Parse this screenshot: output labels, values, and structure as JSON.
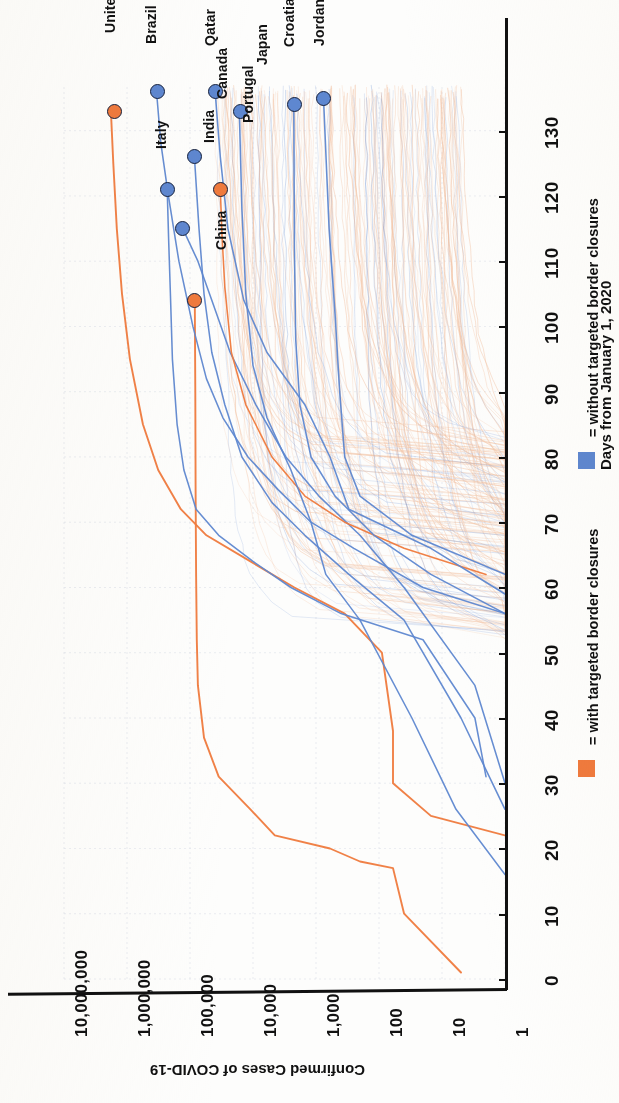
{
  "chart_data": {
    "type": "line",
    "title": "",
    "xlabel": "Days from January 1, 2020",
    "ylabel": "Confirmed Cases of COVID-19",
    "xlim": [
      0,
      137
    ],
    "ylim": [
      1,
      10000000
    ],
    "yscale": "log",
    "xticks": [
      0,
      10,
      20,
      30,
      40,
      50,
      60,
      70,
      80,
      90,
      100,
      110,
      120,
      130
    ],
    "xtick_labels": [
      "0",
      "10",
      "20",
      "30",
      "40",
      "50",
      "60",
      "70",
      "80",
      "90",
      "100",
      "110",
      "120",
      "130"
    ],
    "yticks": [
      1,
      10,
      100,
      1000,
      10000,
      100000,
      1000000,
      10000000
    ],
    "ytick_labels": [
      "1",
      "10",
      "100",
      "1,000",
      "10,000",
      "100,000",
      "1,000,000",
      "10,000,000"
    ],
    "grid": true,
    "orientation": "rotated-90-clockwise",
    "legend_position": "bottom-right",
    "legend": [
      {
        "label": "= with targeted border closures",
        "color": "#ef7a3d",
        "key": "with"
      },
      {
        "label": "= without targeted border closures",
        "color": "#5e87d0",
        "key": "without"
      }
    ],
    "colors": {
      "with_closures": "#ef7a3d",
      "without_closures": "#5e87d0",
      "background_lines": "#f2c0a0",
      "axis": "#111111",
      "grid": "#d9dde6"
    },
    "annotations": [
      {
        "country": "United States",
        "group": "with",
        "color": "#ef7a3d",
        "x": 133,
        "y": 1600000
      },
      {
        "country": "Brazil",
        "group": "without",
        "color": "#5e87d0",
        "x": 136,
        "y": 330000
      },
      {
        "country": "India",
        "group": "without",
        "color": "#5e87d0",
        "x": 115,
        "y": 130000
      },
      {
        "country": "Qatar",
        "group": "without",
        "color": "#5e87d0",
        "x": 136,
        "y": 40000
      },
      {
        "country": "Japan",
        "group": "without",
        "color": "#5e87d0",
        "x": 133,
        "y": 16000
      },
      {
        "country": "Croatia",
        "group": "without",
        "color": "#5e87d0",
        "x": 134,
        "y": 2200
      },
      {
        "country": "Jordan",
        "group": "without",
        "color": "#5e87d0",
        "x": 135,
        "y": 760
      },
      {
        "country": "Italy",
        "group": "without",
        "color": "#5e87d0",
        "x": 121,
        "y": 230000
      },
      {
        "country": "Canada",
        "group": "without",
        "color": "#5e87d0",
        "x": 126,
        "y": 85000
      },
      {
        "country": "Portugal",
        "group": "with",
        "color": "#ef7a3d",
        "x": 121,
        "y": 33000
      },
      {
        "country": "China",
        "group": "with",
        "color": "#ef7a3d",
        "x": 104,
        "y": 84000
      }
    ],
    "series": [
      {
        "name": "United States",
        "group": "with",
        "color": "#ef7a3d",
        "points": [
          [
            22,
            1
          ],
          [
            25,
            15
          ],
          [
            30,
            60
          ],
          [
            38,
            60
          ],
          [
            50,
            90
          ],
          [
            56,
            350
          ],
          [
            60,
            2200
          ],
          [
            64,
            11000
          ],
          [
            68,
            55000
          ],
          [
            72,
            140000
          ],
          [
            78,
            320000
          ],
          [
            85,
            560000
          ],
          [
            95,
            900000
          ],
          [
            105,
            1200000
          ],
          [
            115,
            1450000
          ],
          [
            125,
            1650000
          ],
          [
            133,
            1800000
          ]
        ]
      },
      {
        "name": "China",
        "group": "with",
        "color": "#ef7a3d",
        "points": [
          [
            1,
            5
          ],
          [
            10,
            40
          ],
          [
            17,
            60
          ],
          [
            18,
            200
          ],
          [
            20,
            600
          ],
          [
            22,
            4500
          ],
          [
            26,
            11000
          ],
          [
            31,
            35000
          ],
          [
            37,
            60000
          ],
          [
            45,
            75000
          ],
          [
            52,
            78000
          ],
          [
            62,
            80000
          ],
          [
            75,
            81500
          ],
          [
            90,
            82500
          ],
          [
            104,
            84000
          ]
        ]
      },
      {
        "name": "Italy",
        "group": "without",
        "color": "#5e87d0",
        "points": [
          [
            31,
            2
          ],
          [
            40,
            3
          ],
          [
            52,
            20
          ],
          [
            56,
            400
          ],
          [
            60,
            2500
          ],
          [
            64,
            10000
          ],
          [
            68,
            35000
          ],
          [
            72,
            80000
          ],
          [
            78,
            125000
          ],
          [
            85,
            160000
          ],
          [
            95,
            190000
          ],
          [
            105,
            205000
          ],
          [
            113,
            218000
          ],
          [
            121,
            230000
          ]
        ]
      },
      {
        "name": "Brazil",
        "group": "without",
        "color": "#5e87d0",
        "points": [
          [
            56,
            1
          ],
          [
            60,
            20
          ],
          [
            66,
            250
          ],
          [
            70,
            1200
          ],
          [
            75,
            4000
          ],
          [
            80,
            12000
          ],
          [
            86,
            30000
          ],
          [
            92,
            55000
          ],
          [
            100,
            90000
          ],
          [
            110,
            150000
          ],
          [
            120,
            220000
          ],
          [
            128,
            290000
          ],
          [
            136,
            340000
          ]
        ]
      },
      {
        "name": "Canada",
        "group": "without",
        "color": "#5e87d0",
        "points": [
          [
            26,
            1
          ],
          [
            40,
            5
          ],
          [
            55,
            40
          ],
          [
            62,
            300
          ],
          [
            68,
            1500
          ],
          [
            73,
            5000
          ],
          [
            80,
            15000
          ],
          [
            88,
            28000
          ],
          [
            96,
            45000
          ],
          [
            105,
            60000
          ],
          [
            115,
            72000
          ],
          [
            126,
            85000
          ]
        ]
      },
      {
        "name": "India",
        "group": "without",
        "color": "#5e87d0",
        "points": [
          [
            30,
            1
          ],
          [
            45,
            3
          ],
          [
            60,
            40
          ],
          [
            68,
            200
          ],
          [
            74,
            900
          ],
          [
            80,
            3000
          ],
          [
            88,
            9000
          ],
          [
            96,
            23000
          ],
          [
            104,
            45000
          ],
          [
            110,
            75000
          ],
          [
            115,
            130000
          ]
        ]
      },
      {
        "name": "Portugal",
        "group": "with",
        "color": "#ef7a3d",
        "points": [
          [
            62,
            2
          ],
          [
            66,
            40
          ],
          [
            70,
            350
          ],
          [
            74,
            1500
          ],
          [
            80,
            5000
          ],
          [
            88,
            13000
          ],
          [
            96,
            22000
          ],
          [
            106,
            28000
          ],
          [
            114,
            31000
          ],
          [
            121,
            33000
          ]
        ]
      },
      {
        "name": "Qatar",
        "group": "without",
        "color": "#5e87d0",
        "points": [
          [
            59,
            1
          ],
          [
            66,
            15
          ],
          [
            72,
            300
          ],
          [
            80,
            600
          ],
          [
            88,
            1500
          ],
          [
            96,
            6000
          ],
          [
            104,
            14000
          ],
          [
            115,
            25000
          ],
          [
            126,
            33000
          ],
          [
            136,
            40000
          ]
        ]
      },
      {
        "name": "Japan",
        "group": "without",
        "color": "#5e87d0",
        "points": [
          [
            16,
            1
          ],
          [
            26,
            6
          ],
          [
            40,
            30
          ],
          [
            55,
            200
          ],
          [
            62,
            700
          ],
          [
            70,
            1200
          ],
          [
            78,
            2500
          ],
          [
            86,
            6000
          ],
          [
            94,
            10000
          ],
          [
            105,
            13000
          ],
          [
            118,
            15000
          ],
          [
            133,
            16500
          ]
        ]
      },
      {
        "name": "Croatia",
        "group": "without",
        "color": "#5e87d0",
        "points": [
          [
            56,
            1
          ],
          [
            62,
            15
          ],
          [
            68,
            120
          ],
          [
            74,
            500
          ],
          [
            80,
            1200
          ],
          [
            88,
            1800
          ],
          [
            98,
            2100
          ],
          [
            112,
            2200
          ],
          [
            134,
            2250
          ]
        ]
      },
      {
        "name": "Jordan",
        "group": "without",
        "color": "#5e87d0",
        "points": [
          [
            62,
            1
          ],
          [
            68,
            30
          ],
          [
            74,
            200
          ],
          [
            80,
            350
          ],
          [
            90,
            420
          ],
          [
            102,
            500
          ],
          [
            115,
            620
          ],
          [
            135,
            760
          ]
        ]
      }
    ],
    "background_series_note": "~180 additional faint country trajectories drawn behind the highlighted lines"
  },
  "axis": {
    "x_title": "Days from January 1, 2020",
    "y_title": "Confirmed Cases of COVID-19"
  },
  "legend": {
    "with_label": "= with targeted border closures",
    "without_label": "= without targeted border closures"
  }
}
